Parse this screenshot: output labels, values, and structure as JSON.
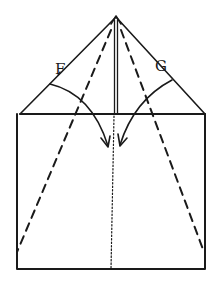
{
  "diagram": {
    "title": "",
    "labels": {
      "F": "F",
      "G": "G"
    },
    "colors": {
      "ink": "#1a1a1a",
      "background": "#ffffff"
    }
  }
}
